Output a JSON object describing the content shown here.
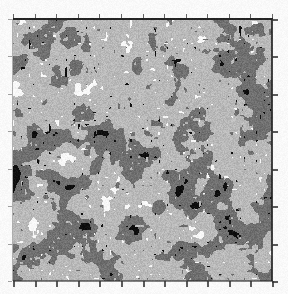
{
  "figure": {
    "kind": "raster-image-plot",
    "caption": "",
    "title": "",
    "background_color": "#ffffff"
  },
  "plot_area": {
    "x": 13,
    "y": 19,
    "width": 259,
    "height": 262,
    "border_color": "#1a1a1a"
  },
  "axes": {
    "top": {
      "tick_count": 12,
      "tick_side": "outward",
      "labels": []
    },
    "bottom": {
      "tick_count": 12,
      "tick_side": "outward",
      "labels": []
    },
    "left": {
      "tick_count": 7,
      "tick_side": "outward",
      "labels": []
    },
    "right": {
      "tick_count": 7,
      "tick_side": "outward",
      "labels": []
    },
    "xlabel": "",
    "ylabel": ""
  },
  "chart_data": {
    "type": "heatmap",
    "title": "",
    "xlabel": "",
    "ylabel": "",
    "legend": [],
    "grid": false,
    "colormap": "grayscale",
    "quantization_levels": 4,
    "level_colors": [
      "#0d0d0d",
      "#6e6e6e",
      "#b4b4b4",
      "#f5f5f5"
    ],
    "level_names": [
      "black",
      "dark-gray",
      "light-gray",
      "white"
    ],
    "level_fractions": [
      0.08,
      0.34,
      0.5,
      0.08
    ],
    "blob_scale_px": 9,
    "noise_seed": 20240517,
    "xlim": [
      0,
      259
    ],
    "ylim": [
      0,
      262
    ]
  }
}
